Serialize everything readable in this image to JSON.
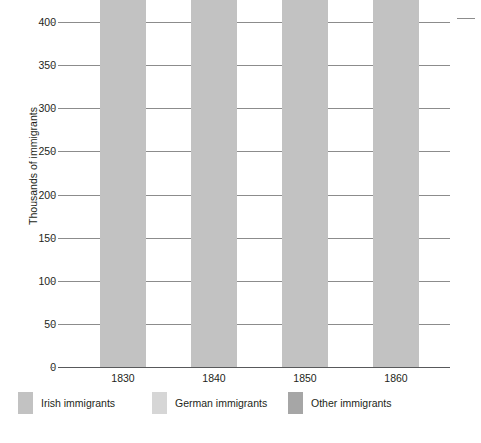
{
  "chart_data": {
    "type": "bar",
    "stacked": true,
    "title": "",
    "xlabel": "",
    "ylabel": "Thousands of immigrants",
    "ylim": [
      0,
      400
    ],
    "ytick_step": 50,
    "yticks": [
      "0",
      "50",
      "100",
      "150",
      "200",
      "250",
      "300",
      "350",
      "400"
    ],
    "grid": true,
    "legend_position": "bottom",
    "categories": [
      "1830",
      "1840",
      "1850",
      "1860"
    ],
    "series": [
      {
        "name": "Irish immigrants",
        "color": "#c2c2c2",
        "values": [
          18625,
          29704,
          78896,
          54491
        ],
        "labels": [
          "",
          "29,704",
          "78,896",
          "54,491"
        ]
      },
      {
        "name": "German immigrants",
        "color": "#d6d6d6",
        "values": [
          2721,
          39430,
          164004,
          48637
        ],
        "labels": [
          "2,721",
          "39,430",
          "164,004",
          "48,637"
        ]
      },
      {
        "name": "Other immigrants",
        "color": "#a6a6a6",
        "values": [
          1976,
          14932,
          127080,
          50512
        ],
        "labels": [
          "1,976",
          "",
          "",
          ""
        ]
      }
    ],
    "totals": [
      23322,
      84066,
      369980,
      153640
    ],
    "total_labels": [
      "23,322",
      "84,066",
      "369,980",
      "153,640"
    ],
    "total_prefix": "Total"
  },
  "axis": {
    "y_title": "Thousands of immigrants",
    "y_ticks": [
      "400",
      "350",
      "300",
      "250",
      "200",
      "150",
      "100",
      "50",
      "0"
    ],
    "x_ticks": [
      "1830",
      "1840",
      "1850",
      "1860"
    ]
  },
  "annotations": {
    "g1830": {
      "total_word": "Total",
      "total_value": "23,322",
      "german": "2,721",
      "other": "1,976"
    },
    "g1840": {
      "total_word": "Total",
      "total_value": "84,066",
      "german": "39,430",
      "irish": "29,704"
    },
    "g1850": {
      "total_word": "Total",
      "total_value": "369,980",
      "german": "164,004",
      "irish": "78,896"
    },
    "g1860": {
      "total_word": "Total",
      "total_value": "153,640",
      "german": "48,637",
      "irish": "54,491"
    }
  },
  "legend": {
    "items": [
      {
        "label": "Irish immigrants",
        "color": "#c2c2c2"
      },
      {
        "label": "German immigrants",
        "color": "#d6d6d6"
      },
      {
        "label": "Other immigrants",
        "color": "#a6a6a6"
      }
    ]
  },
  "colors": {
    "irish": "#c2c2c2",
    "german": "#d6d6d6",
    "other": "#a6a6a6",
    "gridline": "#8c8c8c",
    "axis": "#58595b",
    "text": "#231f20",
    "background": "#ffffff"
  }
}
